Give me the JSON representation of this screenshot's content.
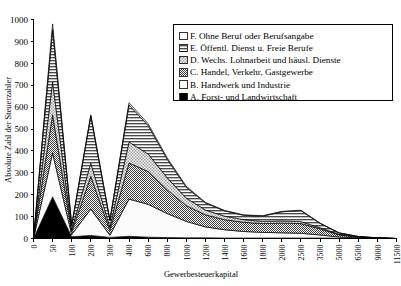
{
  "chart_data": {
    "type": "area",
    "stacked": true,
    "title": "",
    "xlabel": "Gewerbesteuerkapital",
    "ylabel": "Absolute Zahl der Steuerzahler",
    "ylim": [
      0,
      1000
    ],
    "ytick_step": 100,
    "yticks": [
      0,
      100,
      200,
      300,
      400,
      500,
      600,
      700,
      800,
      900,
      1000
    ],
    "grid": false,
    "legend_position": "top-right",
    "x_is_categorical": true,
    "categories": [
      "0",
      "50",
      "100",
      "200",
      "300",
      "400",
      "600",
      "800",
      "1000",
      "1200",
      "1400",
      "1600",
      "1800",
      "2000",
      "2500",
      "3500",
      "5000",
      "6500",
      "9000",
      "11500"
    ],
    "series": [
      {
        "key": "A",
        "name": "A. Forst- und Landwirtschaft",
        "pattern": "solid-black",
        "color": "#000000",
        "values": [
          0,
          190,
          8,
          14,
          5,
          10,
          6,
          4,
          3,
          3,
          2,
          2,
          2,
          2,
          2,
          2,
          1,
          1,
          0,
          0
        ]
      },
      {
        "key": "B",
        "name": "B. Handwerk und Industrie",
        "pattern": "white",
        "color": "#ffffff",
        "values": [
          0,
          200,
          10,
          120,
          10,
          170,
          150,
          110,
          75,
          50,
          38,
          30,
          26,
          24,
          22,
          14,
          6,
          2,
          1,
          0
        ]
      },
      {
        "key": "C",
        "name": "C. Handel, Verkehr, Gastgewerbe",
        "pattern": "dense-checker",
        "color": "#6e6e6e",
        "values": [
          0,
          175,
          12,
          150,
          22,
          165,
          150,
          108,
          72,
          55,
          46,
          42,
          40,
          44,
          44,
          28,
          10,
          3,
          1,
          0
        ]
      },
      {
        "key": "D",
        "name": "D. Wechs. Lohnarbeit und häusl. Dienste",
        "pattern": "light-checker",
        "color": "#b9b9b9",
        "values": [
          0,
          150,
          10,
          60,
          14,
          95,
          80,
          55,
          34,
          22,
          16,
          12,
          10,
          10,
          9,
          5,
          2,
          1,
          0,
          0
        ]
      },
      {
        "key": "E",
        "name": "E. Öffentl. Dienst u. Freie Berufe",
        "pattern": "horizontal-lines",
        "color": "#8f8f8f",
        "values": [
          0,
          240,
          18,
          215,
          30,
          170,
          130,
          85,
          50,
          32,
          24,
          20,
          24,
          42,
          50,
          20,
          6,
          2,
          1,
          0
        ]
      },
      {
        "key": "F",
        "name": "F. Ohne Beruf oder Berufsangabe",
        "pattern": "white",
        "color": "#ffffff",
        "values": [
          0,
          25,
          4,
          6,
          4,
          10,
          8,
          6,
          4,
          3,
          2,
          2,
          2,
          2,
          2,
          1,
          1,
          0,
          0,
          0
        ]
      }
    ],
    "legend_entries": [
      {
        "key": "F",
        "label": "F. Ohne Beruf oder Berufsangabe",
        "pattern": "white"
      },
      {
        "key": "E",
        "label": "E. Öffentl. Dienst u. Freie Berufe",
        "pattern": "horizontal-lines"
      },
      {
        "key": "D",
        "label": "D. Wechs. Lohnarbeit und häusl. Dienste",
        "pattern": "light-checker"
      },
      {
        "key": "C",
        "label": "C. Handel, Verkehr, Gastgewerbe",
        "pattern": "dense-checker"
      },
      {
        "key": "B",
        "label": "B. Handwerk und Industrie",
        "pattern": "white"
      },
      {
        "key": "A",
        "label": "A. Forst- und Landwirtschaft",
        "pattern": "solid-black"
      }
    ]
  }
}
